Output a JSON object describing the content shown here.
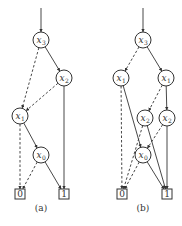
{
  "figure": {
    "panels": [
      {
        "id": "a",
        "caption": "(a)",
        "caption_pos": [
          41,
          211
        ],
        "entry": {
          "from": [
            41,
            8
          ],
          "to": "x3"
        },
        "nodes": [
          {
            "id": "x3",
            "var": "x",
            "sub": "3",
            "type": "decision",
            "pos": [
              41,
              40
            ]
          },
          {
            "id": "x2",
            "var": "x",
            "sub": "2",
            "type": "decision",
            "pos": [
              64,
              78
            ]
          },
          {
            "id": "x1",
            "var": "x",
            "sub": "1",
            "type": "decision",
            "pos": [
              20,
              116
            ]
          },
          {
            "id": "x0",
            "var": "x",
            "sub": "0",
            "type": "decision",
            "pos": [
              41,
              155
            ]
          },
          {
            "id": "t0",
            "label": "0",
            "type": "terminal",
            "pos": [
              20,
              194
            ]
          },
          {
            "id": "t1",
            "label": "1",
            "type": "terminal",
            "pos": [
              64,
              194
            ]
          }
        ],
        "edges": [
          {
            "from": "x3",
            "to": "x2",
            "style": "solid"
          },
          {
            "from": "x3",
            "to": "x1",
            "style": "dashed"
          },
          {
            "from": "x2",
            "to": "x1",
            "style": "dashed"
          },
          {
            "from": "x2",
            "to": "t1",
            "style": "solid"
          },
          {
            "from": "x1",
            "to": "x0",
            "style": "solid"
          },
          {
            "from": "x1",
            "to": "t0",
            "style": "dashed"
          },
          {
            "from": "x0",
            "to": "t0",
            "style": "dashed"
          },
          {
            "from": "x0",
            "to": "t1",
            "style": "solid"
          }
        ]
      },
      {
        "id": "b",
        "caption": "(b)",
        "caption_pos": [
          143,
          211
        ],
        "entry": {
          "from": [
            143,
            8
          ],
          "to": "x3"
        },
        "nodes": [
          {
            "id": "x3",
            "var": "x",
            "sub": "3",
            "type": "decision",
            "pos": [
              143,
              40
            ]
          },
          {
            "id": "x1L",
            "var": "x",
            "sub": "1",
            "type": "decision",
            "pos": [
              121,
              78
            ]
          },
          {
            "id": "x1R",
            "var": "x",
            "sub": "1",
            "type": "decision",
            "pos": [
              166,
              78
            ]
          },
          {
            "id": "x2L",
            "var": "x",
            "sub": "2",
            "type": "decision",
            "pos": [
              145,
              118
            ]
          },
          {
            "id": "x2R",
            "var": "x",
            "sub": "2",
            "type": "decision",
            "pos": [
              167,
              118
            ]
          },
          {
            "id": "x0",
            "var": "x",
            "sub": "0",
            "type": "decision",
            "pos": [
              143,
              155
            ]
          },
          {
            "id": "t0",
            "label": "0",
            "type": "terminal",
            "pos": [
              122,
              194
            ]
          },
          {
            "id": "t1",
            "label": "1",
            "type": "terminal",
            "pos": [
              167,
              194
            ]
          }
        ],
        "edges": [
          {
            "from": "x3",
            "to": "x1L",
            "style": "dashed"
          },
          {
            "from": "x3",
            "to": "x1R",
            "style": "solid"
          },
          {
            "from": "x1L",
            "to": "t0",
            "style": "dashed"
          },
          {
            "from": "x1L",
            "to": "x0",
            "style": "solid"
          },
          {
            "from": "x1R",
            "to": "x2L",
            "style": "dashed"
          },
          {
            "from": "x1R",
            "to": "x2R",
            "style": "solid"
          },
          {
            "from": "x2L",
            "to": "t0",
            "style": "dashed"
          },
          {
            "from": "x2L",
            "to": "t1",
            "style": "solid"
          },
          {
            "from": "x2R",
            "to": "x0",
            "style": "dashed"
          },
          {
            "from": "x2R",
            "to": "t1",
            "style": "solid"
          },
          {
            "from": "x0",
            "to": "t0",
            "style": "dashed"
          },
          {
            "from": "x0",
            "to": "t1",
            "style": "solid"
          }
        ]
      }
    ],
    "style": {
      "stroke": "#333333",
      "node_radius": 8,
      "box_size": 10
    }
  }
}
